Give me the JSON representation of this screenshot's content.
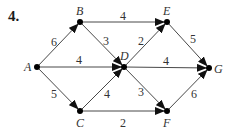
{
  "problem": {
    "number": "4."
  },
  "diagram": {
    "type": "directed-weighted-graph",
    "nodes": [
      {
        "id": "A",
        "label": "A",
        "x": 37,
        "y": 67,
        "lx": 24,
        "ly": 71
      },
      {
        "id": "B",
        "label": "B",
        "x": 80,
        "y": 22,
        "lx": 76,
        "ly": 15
      },
      {
        "id": "C",
        "label": "C",
        "x": 80,
        "y": 111,
        "lx": 76,
        "ly": 127
      },
      {
        "id": "D",
        "label": "D",
        "x": 124,
        "y": 67,
        "lx": 120,
        "ly": 60
      },
      {
        "id": "E",
        "label": "E",
        "x": 167,
        "y": 22,
        "lx": 163,
        "ly": 15
      },
      {
        "id": "F",
        "label": "F",
        "x": 167,
        "y": 111,
        "lx": 163,
        "ly": 127
      },
      {
        "id": "G",
        "label": "G",
        "x": 209,
        "y": 68,
        "lx": 214,
        "ly": 73
      }
    ],
    "edges": [
      {
        "from": "A",
        "to": "B",
        "weight": "6",
        "wx": 51,
        "wy": 46
      },
      {
        "from": "A",
        "to": "D",
        "weight": "4",
        "wx": 76,
        "wy": 64
      },
      {
        "from": "A",
        "to": "C",
        "weight": "5",
        "wx": 51,
        "wy": 98
      },
      {
        "from": "B",
        "to": "E",
        "weight": "4",
        "wx": 120,
        "wy": 20
      },
      {
        "from": "B",
        "to": "D",
        "weight": "3",
        "wx": 103,
        "wy": 45
      },
      {
        "from": "C",
        "to": "D",
        "weight": "4",
        "wx": 104,
        "wy": 98
      },
      {
        "from": "C",
        "to": "F",
        "weight": "2",
        "wx": 120,
        "wy": 127
      },
      {
        "from": "D",
        "to": "E",
        "weight": "2",
        "wx": 138,
        "wy": 45
      },
      {
        "from": "D",
        "to": "G",
        "weight": "4",
        "wx": 163,
        "wy": 65
      },
      {
        "from": "D",
        "to": "F",
        "weight": "3",
        "wx": 138,
        "wy": 96
      },
      {
        "from": "E",
        "to": "G",
        "weight": "5",
        "wx": 190,
        "wy": 43
      },
      {
        "from": "F",
        "to": "G",
        "weight": "6",
        "wx": 191,
        "wy": 98
      }
    ]
  }
}
